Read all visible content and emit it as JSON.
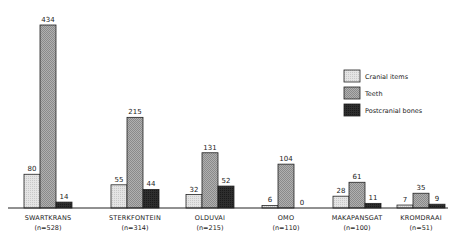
{
  "chart_data": {
    "type": "bar",
    "title": "",
    "xlabel": "",
    "ylabel": "",
    "ylim": [
      0,
      434
    ],
    "grid": false,
    "legend_position": "upper right",
    "categories": [
      "SWARTKRANS",
      "STERKFONTEIN",
      "OLDUVAI",
      "OMO",
      "MAKAPANSGAT",
      "KROMDRAAI"
    ],
    "category_n": [
      "(n=528)",
      "(n=314)",
      "(n=215)",
      "(n=110)",
      "(n=100)",
      "(n=51)"
    ],
    "series": [
      {
        "name": "Cranial items",
        "key": "cranial",
        "values": [
          80,
          55,
          32,
          6,
          28,
          7
        ]
      },
      {
        "name": "Teeth",
        "key": "teeth",
        "values": [
          434,
          215,
          131,
          104,
          61,
          35
        ]
      },
      {
        "name": "Postcranial bones",
        "key": "post",
        "values": [
          14,
          44,
          52,
          0,
          11,
          9
        ]
      }
    ]
  },
  "legend": {
    "items": [
      {
        "label": "Cranial items",
        "color": "#e0e0e0"
      },
      {
        "label": "Teeth",
        "color": "#a8a8a8"
      },
      {
        "label": "Postcranial bones",
        "color": "#2a2a2a"
      }
    ]
  },
  "colors": {
    "cranial": "#e0e0e0",
    "teeth": "#a8a8a8",
    "post": "#2a2a2a",
    "axis": "#222222"
  }
}
